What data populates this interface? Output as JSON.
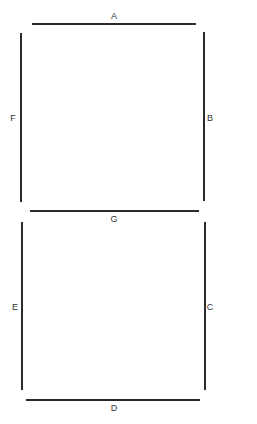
{
  "diagram": {
    "line_color": "#2a2a2a",
    "label_color": "#333333",
    "segments": [
      {
        "id": "A",
        "label": "A",
        "orientation": "horizontal",
        "x1": 32,
        "y1": 24,
        "x2": 196,
        "y2": 24,
        "label_x": 109,
        "label_y": 11
      },
      {
        "id": "B",
        "label": "B",
        "orientation": "vertical",
        "x1": 204,
        "y1": 32,
        "x2": 204,
        "y2": 201,
        "label_x": 205,
        "label_y": 113
      },
      {
        "id": "C",
        "label": "C",
        "orientation": "vertical",
        "x1": 205,
        "y1": 222,
        "x2": 205,
        "y2": 390,
        "label_x": 205,
        "label_y": 302
      },
      {
        "id": "D",
        "label": "D",
        "orientation": "horizontal",
        "x1": 26,
        "y1": 400,
        "x2": 200,
        "y2": 400,
        "label_x": 109,
        "label_y": 403
      },
      {
        "id": "E",
        "label": "E",
        "orientation": "vertical",
        "x1": 22,
        "y1": 222,
        "x2": 22,
        "y2": 390,
        "label_x": 10,
        "label_y": 302
      },
      {
        "id": "F",
        "label": "F",
        "orientation": "vertical",
        "x1": 21,
        "y1": 33,
        "x2": 21,
        "y2": 202,
        "label_x": 8,
        "label_y": 113
      },
      {
        "id": "G",
        "label": "G",
        "orientation": "horizontal",
        "x1": 30,
        "y1": 211,
        "x2": 199,
        "y2": 211,
        "label_x": 109,
        "label_y": 214
      }
    ]
  }
}
